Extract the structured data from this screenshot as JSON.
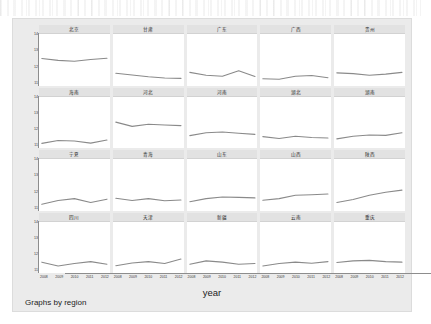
{
  "figure": {
    "caption": "Graphs by region",
    "xlabel": "year",
    "background_color": "#ebebeb",
    "panel_background_color": "#ffffff",
    "title_strip_color": "#e2e2e2",
    "line_color": "#8a8a8a"
  },
  "chart_data": {
    "type": "line",
    "title": "",
    "subtitle": "",
    "xlabel": "year",
    "ylabel": "",
    "grid": false,
    "legend": null,
    "layout": {
      "rows": 4,
      "cols": 5,
      "by": "region"
    },
    "x": [
      2008,
      2009,
      2010,
      2011,
      2012
    ],
    "xtick_labels": [
      "2008",
      "2009",
      "2010",
      "2011",
      "2012"
    ],
    "xlim": [
      2008,
      2012
    ],
    "ylim": [
      10,
      14
    ],
    "ytick_labels": [
      "14",
      "13",
      "12",
      "11"
    ],
    "ytick_values": [
      14,
      13,
      12,
      11
    ],
    "panels": [
      {
        "region": "北京",
        "values": [
          12.1,
          11.95,
          11.88,
          12.02,
          12.12
        ]
      },
      {
        "region": "甘肃",
        "values": [
          10.95,
          10.82,
          10.68,
          10.58,
          10.55
        ]
      },
      {
        "region": "广东",
        "values": [
          11.02,
          10.8,
          10.72,
          11.15,
          10.7
        ]
      },
      {
        "region": "广西",
        "values": [
          10.52,
          10.48,
          10.72,
          10.78,
          10.6
        ]
      },
      {
        "region": "贵州",
        "values": [
          10.98,
          10.92,
          10.8,
          10.88,
          11.02
        ]
      },
      {
        "region": "海南",
        "values": [
          10.4,
          10.62,
          10.58,
          10.42,
          10.66
        ]
      },
      {
        "region": "河北",
        "values": [
          12.05,
          11.72,
          11.88,
          11.82,
          11.78
        ]
      },
      {
        "region": "河南",
        "values": [
          11.0,
          11.22,
          11.28,
          11.18,
          11.1
        ]
      },
      {
        "region": "湖北",
        "values": [
          10.92,
          10.78,
          10.95,
          10.86,
          10.82
        ]
      },
      {
        "region": "湖南",
        "values": [
          10.75,
          10.95,
          11.05,
          11.02,
          11.22
        ]
      },
      {
        "region": "宁夏",
        "values": [
          10.48,
          10.78,
          10.92,
          10.62,
          10.88
        ]
      },
      {
        "region": "青海",
        "values": [
          10.95,
          10.78,
          10.92,
          10.76,
          10.82
        ]
      },
      {
        "region": "山东",
        "values": [
          10.68,
          10.92,
          11.05,
          11.02,
          10.98
        ]
      },
      {
        "region": "山西",
        "values": [
          10.8,
          10.92,
          11.18,
          11.22,
          11.28
        ]
      },
      {
        "region": "陕西",
        "values": [
          10.62,
          10.85,
          11.18,
          11.42,
          11.58
        ]
      },
      {
        "region": "四川",
        "values": [
          10.88,
          10.58,
          10.78,
          10.92,
          10.72
        ]
      },
      {
        "region": "天津",
        "values": [
          10.6,
          10.82,
          10.92,
          10.78,
          11.12
        ]
      },
      {
        "region": "新疆",
        "values": [
          10.72,
          10.98,
          10.88,
          10.72,
          10.78
        ]
      },
      {
        "region": "云南",
        "values": [
          10.58,
          10.78,
          10.88,
          10.8,
          10.92
        ]
      },
      {
        "region": "重庆",
        "values": [
          10.85,
          10.98,
          11.02,
          10.92,
          10.88
        ]
      }
    ]
  }
}
